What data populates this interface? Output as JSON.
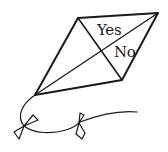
{
  "illustration": {
    "subject": "kite",
    "labels": {
      "upper_section": "Yes",
      "lower_section": "No"
    },
    "stroke_color": "#1a1a1a",
    "background": "#ffffff"
  }
}
